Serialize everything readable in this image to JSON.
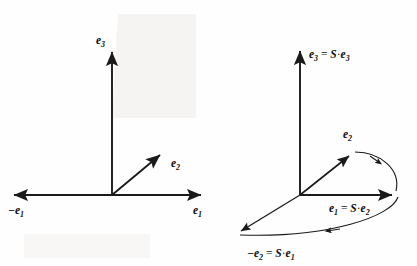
{
  "figure": {
    "background_color": "#fefefe",
    "stroke_color": "#1a1a1a"
  },
  "left_diagram": {
    "name": "original-basis-frame",
    "origin": {
      "x": 112,
      "y": 195
    },
    "axes": [
      {
        "id": "e3-axis",
        "label": "e",
        "subscript": "3",
        "direction": "up",
        "tip": {
          "x": 112,
          "y": 48
        },
        "label_pos": {
          "x": 98,
          "y": 40
        }
      },
      {
        "id": "e1-axis-positive",
        "label": "e",
        "subscript": "1",
        "direction": "right",
        "tip": {
          "x": 205,
          "y": 195
        },
        "label_pos": {
          "x": 194,
          "y": 212
        }
      },
      {
        "id": "e1-axis-negative",
        "label": "−e",
        "subscript": "1",
        "direction": "left",
        "tip": {
          "x": 10,
          "y": 195
        },
        "label_pos": {
          "x": 10,
          "y": 212
        }
      }
    ],
    "vectors": [
      {
        "id": "e2-vector",
        "label": "e",
        "subscript": "2",
        "tip": {
          "x": 163,
          "y": 152
        },
        "label_pos": {
          "x": 172,
          "y": 165
        }
      }
    ]
  },
  "right_diagram": {
    "name": "transformed-basis-frame",
    "origin": {
      "x": 300,
      "y": 195
    },
    "axes": [
      {
        "id": "e3-transformed-axis",
        "label_parts": [
          "e",
          "3",
          " = ",
          "S",
          " · ",
          "e",
          "3"
        ],
        "label_text": "e₃ = S · e₃",
        "direction": "up",
        "tip": {
          "x": 300,
          "y": 47
        },
        "label_pos": {
          "x": 308,
          "y": 57
        }
      },
      {
        "id": "e1-transformed-axis",
        "label_text": "e₁ = S · e₂",
        "direction": "right",
        "tip": {
          "x": 396,
          "y": 195
        },
        "label_pos": {
          "x": 328,
          "y": 209
        }
      }
    ],
    "vectors": [
      {
        "id": "e2-vector",
        "label_text": "e₂",
        "tip": {
          "x": 352,
          "y": 153
        },
        "label_pos": {
          "x": 344,
          "y": 133
        }
      },
      {
        "id": "minus-e2-transformed-vector",
        "label_text": "−e₂ = S · e₁",
        "tip": {
          "x": 238,
          "y": 234
        },
        "label_pos": {
          "x": 248,
          "y": 256
        }
      }
    ],
    "rotation_arcs": [
      {
        "id": "arc-e2-to-e1",
        "from": "e2-vector-tip",
        "to": "e1-axis-tip",
        "direction": "clockwise"
      },
      {
        "id": "arc-e1-to-minus-e2",
        "from": "e1-axis-tip",
        "to": "minus-e2-vector-tip",
        "direction": "clockwise"
      }
    ]
  },
  "labels": {
    "left": {
      "e3": "e",
      "e3_sub": "3",
      "e1_pos": "e",
      "e1_pos_sub": "1",
      "e1_neg": "−e",
      "e1_neg_sub": "1",
      "e2": "e",
      "e2_sub": "2"
    },
    "right": {
      "e3_eq_lhs": "e",
      "e3_eq_lhs_sub": "3",
      "e3_eq_op": "=",
      "e3_eq_S": "S",
      "e3_eq_dot": "·",
      "e3_eq_rhs": "e",
      "e3_eq_rhs_sub": "3",
      "e1_eq_lhs": "e",
      "e1_eq_lhs_sub": "1",
      "e1_eq_op": "=",
      "e1_eq_S": "S",
      "e1_eq_dot": "·",
      "e1_eq_rhs": "e",
      "e1_eq_rhs_sub": "2",
      "e2": "e",
      "e2_sub": "2",
      "me2_eq_lhs": "−e",
      "me2_eq_lhs_sub": "2",
      "me2_eq_op": "=",
      "me2_eq_S": "S",
      "me2_eq_dot": "·",
      "me2_eq_rhs": "e",
      "me2_eq_rhs_sub": "1"
    }
  }
}
